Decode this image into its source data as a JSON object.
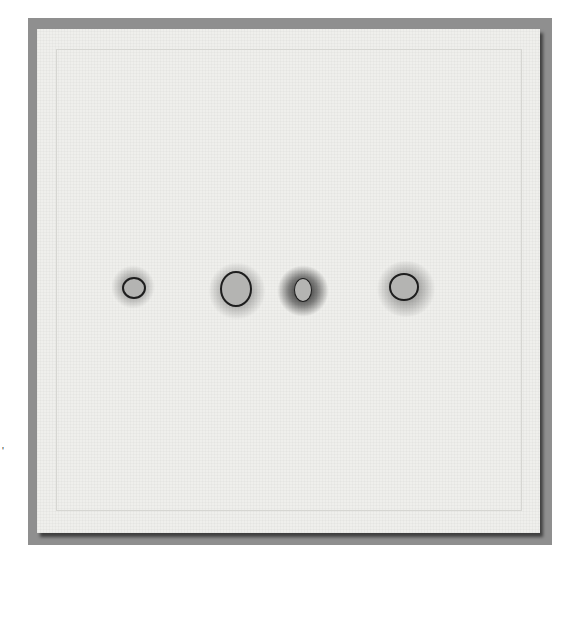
{
  "artwork": {
    "description": "Photograph of a white textile panel with four burned/frayed holes in a horizontal row, mounted on grey background",
    "colors": {
      "background": "#ffffff",
      "mat": "#8f8f8f",
      "fabric": "#efefec",
      "hole_fill": "#b4b4b2",
      "hole_edge": "#1e1e1e"
    },
    "holes": [
      {
        "id": 1,
        "cx": 97,
        "cy": 259,
        "w": 24,
        "h": 22
      },
      {
        "id": 2,
        "cx": 199,
        "cy": 260,
        "w": 32,
        "h": 36
      },
      {
        "id": 3,
        "cx": 266,
        "cy": 261,
        "w": 18,
        "h": 24
      },
      {
        "id": 4,
        "cx": 367,
        "cy": 258,
        "w": 30,
        "h": 28
      }
    ],
    "margin_mark": "'"
  }
}
